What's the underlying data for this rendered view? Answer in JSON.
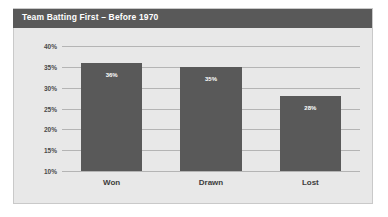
{
  "title": {
    "text": "Team Batting First – Before 1970"
  },
  "colors": {
    "title_bar": "#595959",
    "title_text": "#ffffff",
    "bar": "#595959",
    "panel_background": "#e8e8e8",
    "page_background": "#ffffff",
    "gridline": "#b4b4b4",
    "axis_text": "#4a4a4a",
    "category_text": "#3d3d3d",
    "data_label_text": "#ffffff"
  },
  "chart_data": {
    "type": "bar",
    "title": "Team Batting First – Before 1970",
    "xlabel": "",
    "ylabel": "",
    "categories": [
      "Won",
      "Drawn",
      "Lost"
    ],
    "values": [
      36,
      35,
      28
    ],
    "data_labels": [
      "36%",
      "35%",
      "28%"
    ],
    "ylim": [
      10,
      40
    ],
    "ytick_values": [
      40,
      35,
      30,
      25,
      20,
      15,
      10
    ],
    "ytick_labels": [
      "40%",
      "35%",
      "30%",
      "25%",
      "20%",
      "15%",
      "10%"
    ],
    "grid": true,
    "grid_axis": "y",
    "legend": false,
    "legend_position": "none",
    "orientation": "vertical",
    "value_unit": "%"
  }
}
